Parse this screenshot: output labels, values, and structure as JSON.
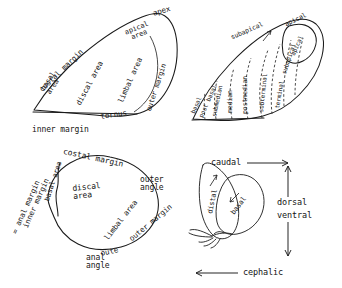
{
  "figure": {
    "ink_color": "#1a1a1a",
    "background_color": "#ffffff"
  },
  "forewing": {
    "name": "forewing",
    "labels": {
      "apex": "apex",
      "apical_area": "apical\narea",
      "costal_margin": "costal margin",
      "basal_area": "basal\narea",
      "discal_area": "discal area",
      "limbal_area": "limbal area",
      "outer_margin": "outer margin",
      "tornus": "tornus",
      "inner_margin": "inner margin"
    }
  },
  "banded_wing": {
    "name": "banded-wing",
    "bands": [
      "basal",
      "post basal",
      "submedian",
      "median",
      "postmedian",
      "subterminal",
      "terminal",
      "subapical",
      "apical"
    ],
    "callouts": [
      "subapical",
      "apical"
    ]
  },
  "hindwing": {
    "name": "hindwing",
    "labels": {
      "costal_margin": "costal margin",
      "basal_area": "basal area",
      "discal_area": "discal\narea",
      "limbal_area": "limbal area",
      "outer_angle": "outer\nangle",
      "outer_margin": "outer margin",
      "outer_short": "oute",
      "anal_angle": "anal\nangle",
      "inner_margin": "inner margin",
      "anal_margin": "= anal margin"
    }
  },
  "orientation": {
    "name": "orientation-key",
    "caudal": "caudal",
    "cephalic": "cephalic",
    "dorsal": "dorsal",
    "ventral": "ventral",
    "distal": "distal",
    "basal": "basal"
  }
}
